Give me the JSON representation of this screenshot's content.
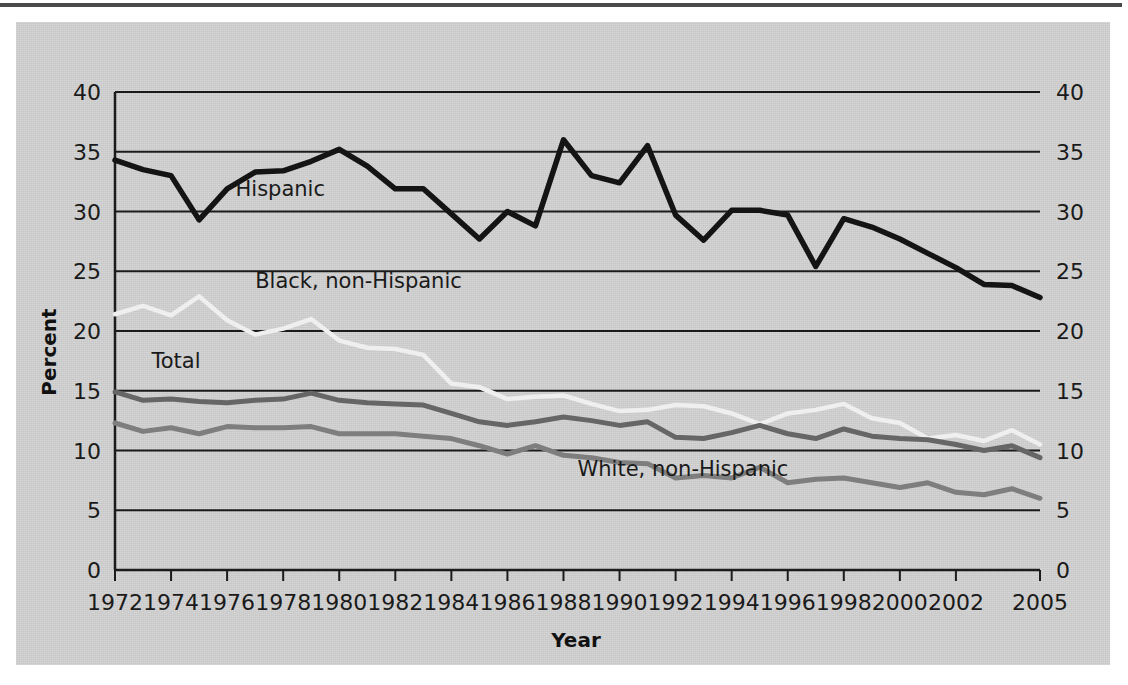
{
  "figure": {
    "panel_background": "#cfcfcf",
    "rule_color": "#4a4a4a"
  },
  "chart_data": {
    "type": "line",
    "title": "",
    "xlabel": "Year",
    "ylabel": "Percent",
    "ylim": [
      0,
      40
    ],
    "xlim": [
      1972,
      2005
    ],
    "grid": true,
    "legend": "inline-labels",
    "ytick_labels": [
      "0",
      "5",
      "10",
      "15",
      "20",
      "25",
      "30",
      "35",
      "40"
    ],
    "ytick_values": [
      0,
      5,
      10,
      15,
      20,
      25,
      30,
      35,
      40
    ],
    "ytick_labels_right": [
      "0",
      "5",
      "10",
      "15",
      "20",
      "25",
      "30",
      "35",
      "40"
    ],
    "xtick_labels": [
      "1972",
      "1974",
      "1976",
      "1978",
      "1980",
      "1982",
      "1984",
      "1986",
      "1988",
      "1990",
      "1992",
      "1994",
      "1996",
      "1998",
      "2000",
      "2002",
      "2005"
    ],
    "xtick_values": [
      1972,
      1974,
      1976,
      1978,
      1980,
      1982,
      1984,
      1986,
      1988,
      1990,
      1992,
      1994,
      1996,
      1998,
      2000,
      2002,
      2005
    ],
    "x": [
      1972,
      1973,
      1974,
      1975,
      1976,
      1977,
      1978,
      1979,
      1980,
      1981,
      1982,
      1983,
      1984,
      1985,
      1986,
      1987,
      1988,
      1989,
      1990,
      1991,
      1992,
      1993,
      1994,
      1995,
      1996,
      1997,
      1998,
      1999,
      2000,
      2001,
      2002,
      2003,
      2004,
      2005
    ],
    "series": [
      {
        "name": "Hispanic",
        "color": "#141414",
        "width": 5.5,
        "label_x": 1976.3,
        "label_y": 31.3,
        "values": [
          34.3,
          33.5,
          33.0,
          29.3,
          31.9,
          33.3,
          33.4,
          34.2,
          35.2,
          33.8,
          31.9,
          31.9,
          29.8,
          27.7,
          30.0,
          28.8,
          36.0,
          33.0,
          32.4,
          35.5,
          29.7,
          27.6,
          30.1,
          30.1,
          29.7,
          25.4,
          29.4,
          28.7,
          27.7,
          26.5,
          25.3,
          23.9,
          23.8,
          22.8
        ]
      },
      {
        "name": "Black, non-Hispanic",
        "color": "#efefef",
        "width": 4.5,
        "label_x": 1977.0,
        "label_y": 23.6,
        "values": [
          21.4,
          22.1,
          21.3,
          22.9,
          20.9,
          19.7,
          20.2,
          21.0,
          19.2,
          18.6,
          18.5,
          18.0,
          15.6,
          15.3,
          14.3,
          14.5,
          14.6,
          13.9,
          13.3,
          13.4,
          13.8,
          13.7,
          13.1,
          12.2,
          13.1,
          13.4,
          13.9,
          12.7,
          12.3,
          11.0,
          11.3,
          10.8,
          11.7,
          10.5
        ]
      },
      {
        "name": "Total",
        "color": "#666666",
        "width": 5.0,
        "label_x": 1973.3,
        "label_y": 16.9,
        "values": [
          14.9,
          14.2,
          14.3,
          14.1,
          14.0,
          14.2,
          14.3,
          14.8,
          14.2,
          14.0,
          13.9,
          13.8,
          13.1,
          12.4,
          12.1,
          12.4,
          12.8,
          12.5,
          12.1,
          12.4,
          11.1,
          11.0,
          11.5,
          12.1,
          11.4,
          11.0,
          11.8,
          11.2,
          11.0,
          10.9,
          10.5,
          10.0,
          10.4,
          9.4
        ]
      },
      {
        "name": "White, non-Hispanic",
        "color": "#7e7e7e",
        "width": 5.0,
        "label_x": 1988.5,
        "label_y": 7.9,
        "values": [
          12.3,
          11.6,
          11.9,
          11.4,
          12.0,
          11.9,
          11.9,
          12.0,
          11.4,
          11.4,
          11.4,
          11.2,
          11.0,
          10.4,
          9.7,
          10.4,
          9.6,
          9.4,
          9.0,
          8.9,
          7.7,
          7.9,
          7.7,
          8.6,
          7.3,
          7.6,
          7.7,
          7.3,
          6.9,
          7.3,
          6.5,
          6.3,
          6.8,
          6.0
        ]
      }
    ]
  }
}
